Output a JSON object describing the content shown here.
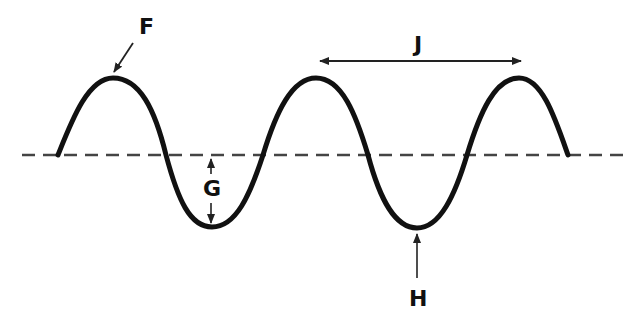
{
  "diagram": {
    "type": "transverse-wave",
    "colors": {
      "wave": "#111111",
      "baseline": "#444444",
      "arrow": "#222222",
      "background": "#ffffff"
    },
    "baseline": {
      "style": "dashed",
      "y": 155,
      "x_start": 22,
      "x_end": 630
    },
    "wave_points": {
      "start": [
        58,
        155
      ],
      "crests": [
        [
          113,
          78
        ],
        [
          316,
          78
        ],
        [
          519,
          78
        ]
      ],
      "troughs": [
        [
          212,
          227
        ],
        [
          417,
          228
        ]
      ],
      "end": [
        568,
        155
      ]
    },
    "labels": {
      "F": "F",
      "G": "G",
      "H": "H",
      "J": "J"
    },
    "annotations": [
      {
        "label": "F",
        "points_to": "crest"
      },
      {
        "label": "G",
        "indicates": "amplitude (rest line to trough)"
      },
      {
        "label": "H",
        "points_to": "trough"
      },
      {
        "label": "J",
        "indicates": "wavelength (crest to crest)"
      }
    ]
  }
}
